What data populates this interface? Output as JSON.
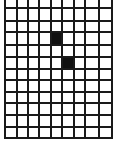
{
  "grid": {
    "columns": 9,
    "full_rows": 11,
    "partial_top_row": true,
    "line_color": "#1a1a1a",
    "fill_color": "#111111",
    "background": "#ffffff",
    "x_lines": [
      5,
      17,
      28,
      39,
      51,
      62,
      74,
      85,
      99,
      112
    ],
    "y_lines": [
      8,
      21,
      32,
      45,
      57,
      69,
      80,
      92,
      103,
      115,
      127,
      138
    ],
    "filled_cells": [
      {
        "col": 4,
        "row": 2
      },
      {
        "col": 5,
        "row": 4
      }
    ]
  }
}
